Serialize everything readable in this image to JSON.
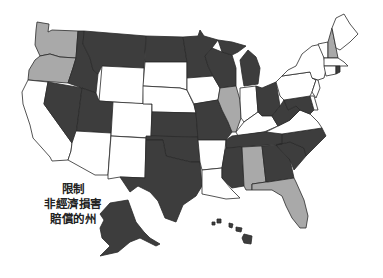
{
  "legend": {
    "lines": [
      "限制",
      "非經濟損害",
      "賠償的州"
    ]
  },
  "colors": {
    "limit": "#3d3d3d",
    "partial": "#a9a9a9",
    "none": "#ffffff",
    "border": "#2a2a2a"
  },
  "states": {
    "limit": [
      "ID",
      "MT",
      "ND",
      "MN",
      "WI",
      "MI",
      "NV",
      "UT",
      "KS",
      "MO",
      "OK",
      "TX",
      "MS",
      "TN",
      "NC",
      "SC",
      "GA",
      "OH",
      "WV",
      "MD",
      "CO_NO",
      "AK",
      "HI",
      "LA_NO",
      "IA_NO",
      "RI",
      "VA_NO",
      "SD_NO",
      "NM_NO"
    ],
    "partial": [
      "WA",
      "OR",
      "IL",
      "AL",
      "FL",
      "NH"
    ],
    "none": [
      "CA",
      "AZ",
      "NM",
      "CO",
      "WY",
      "SD",
      "NE",
      "IA",
      "AR",
      "LA",
      "IN",
      "KY",
      "VA",
      "PA",
      "NY",
      "VT",
      "ME",
      "MA",
      "CT",
      "NJ",
      "DE"
    ]
  }
}
